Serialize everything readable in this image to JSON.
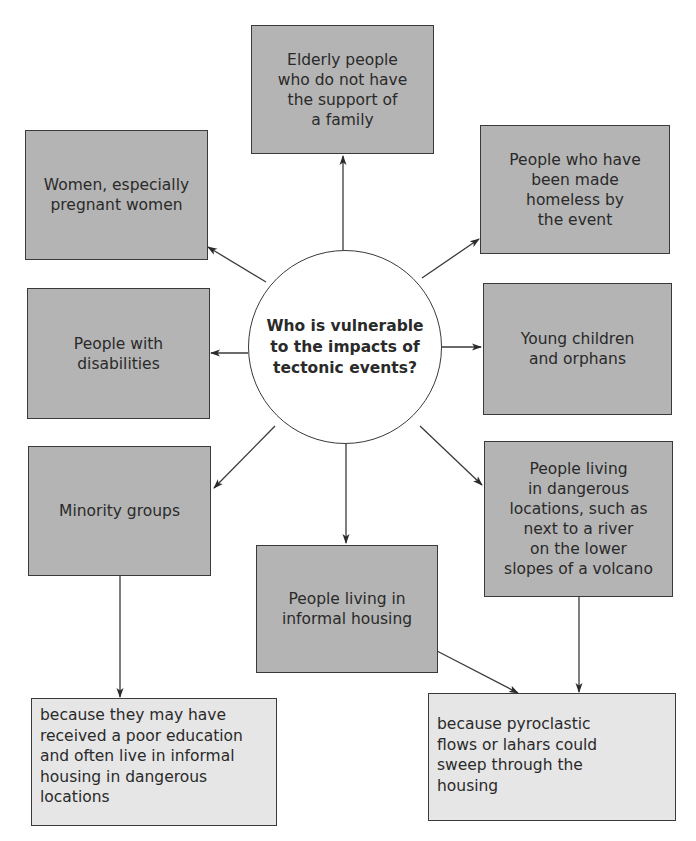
{
  "center": {
    "question": "Who is vulnerable\nto the impacts of\ntectonic events?"
  },
  "groups": [
    {
      "id": "elderly",
      "label": "Elderly people\nwho do not have\nthe support of\na family"
    },
    {
      "id": "women",
      "label": "Women, especially\npregnant women"
    },
    {
      "id": "homeless",
      "label": "People who have\nbeen made\nhomeless by\nthe event"
    },
    {
      "id": "disabilities",
      "label": "People with\ndisabilities"
    },
    {
      "id": "children",
      "label": "Young children\nand orphans"
    },
    {
      "id": "minority",
      "label": "Minority groups"
    },
    {
      "id": "dangerous-locations",
      "label": "People living\nin dangerous\nlocations, such as\nnext to a river\non the lower\nslopes of a volcano"
    },
    {
      "id": "informal-housing",
      "label": "People living in\ninformal housing"
    }
  ],
  "explanations": [
    {
      "id": "minority-reason",
      "label": "because they may have\nreceived a poor education\nand often live in informal\nhousing in dangerous\nlocations"
    },
    {
      "id": "housing-reason",
      "label": "because pyroclastic\nflows or lahars could\nsweep through the\nhousing"
    }
  ],
  "colors": {
    "group_fill": "#b4b4b4",
    "explanation_fill": "#e6e6e6",
    "circle_fill": "#ffffff",
    "stroke": "#3a3a3a"
  }
}
